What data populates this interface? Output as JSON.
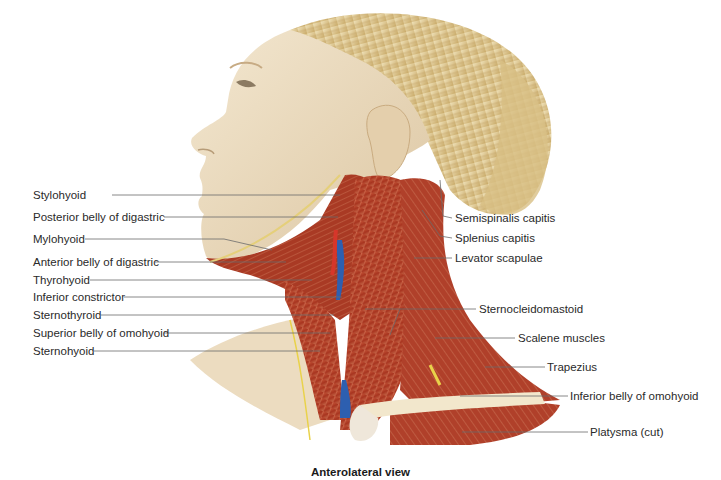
{
  "figure": {
    "caption": "Anterolateral view",
    "colors": {
      "skin": "#efe0c6",
      "skin_shadow": "#d9c3a0",
      "hair": "#e6d3a3",
      "hair_shadow": "#c9ad72",
      "muscle": "#b8412a",
      "muscle_dark": "#8e2416",
      "muscle_light": "#d98a68",
      "vein": "#2d5fb0",
      "artery": "#d6362a",
      "nerve": "#e9d24a",
      "bone": "#f3ead2",
      "leader_line": "#6b6b6b",
      "text": "#2a2a2a"
    },
    "labels_left": [
      {
        "text": "Stylohyoid",
        "y": 195
      },
      {
        "text": "Posterior belly of digastric",
        "y": 217
      },
      {
        "text": "Mylohyoid",
        "y": 239
      },
      {
        "text": "Anterior belly of digastric",
        "y": 262
      },
      {
        "text": "Thyrohyoid",
        "y": 280
      },
      {
        "text": "Inferior constrictor",
        "y": 297
      },
      {
        "text": "Sternothyroid",
        "y": 315
      },
      {
        "text": "Superior belly of omohyoid",
        "y": 333
      },
      {
        "text": "Sternohyoid",
        "y": 351
      }
    ],
    "labels_right": [
      {
        "text": "Semispinalis capitis",
        "y": 218
      },
      {
        "text": "Splenius capitis",
        "y": 238
      },
      {
        "text": "Levator scapulae",
        "y": 258
      },
      {
        "text": "Sternocleidomastoid",
        "y": 309
      },
      {
        "text": "Scalene muscles",
        "y": 338
      },
      {
        "text": "Trapezius",
        "y": 367
      },
      {
        "text": "Inferior belly of omohyoid",
        "y": 396
      },
      {
        "text": "Platysma (cut)",
        "y": 432
      }
    ]
  }
}
